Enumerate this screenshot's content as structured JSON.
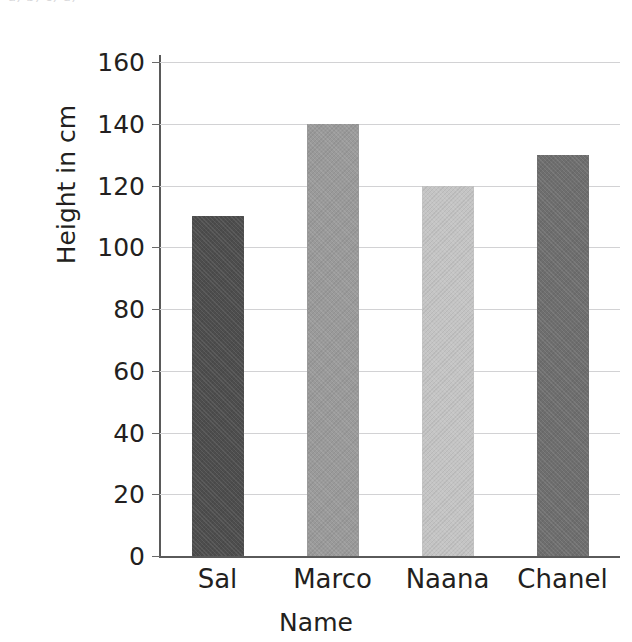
{
  "page": {
    "top_cut_text": "a)    b)    c)    d)"
  },
  "chart_data": {
    "type": "bar",
    "title": "",
    "subtitle": "",
    "xlabel": "Name",
    "ylabel": "Height in cm",
    "categories": [
      "Sal",
      "Marco",
      "Naana",
      "Chanel"
    ],
    "values": [
      110,
      140,
      120,
      130
    ],
    "series": [
      {
        "name": "Height in cm",
        "values": [
          110,
          140,
          120,
          130
        ]
      }
    ],
    "ylim": [
      0,
      160
    ],
    "ytick_labels": [
      "0",
      "20",
      "40",
      "60",
      "80",
      "100",
      "120",
      "140",
      "160"
    ],
    "ytick_values": [
      0,
      20,
      40,
      60,
      80,
      100,
      120,
      140,
      160
    ],
    "grid": true,
    "grid_axis": "y",
    "legend": false,
    "legend_position": "none",
    "bar_colors": [
      "#4d4d4d",
      "#9a9a9a",
      "#c4c4c4",
      "#6e6e6e"
    ],
    "grid_color": "#d2d2d4",
    "axis_color": "#5a5a5a",
    "text_color": "#231f20"
  }
}
